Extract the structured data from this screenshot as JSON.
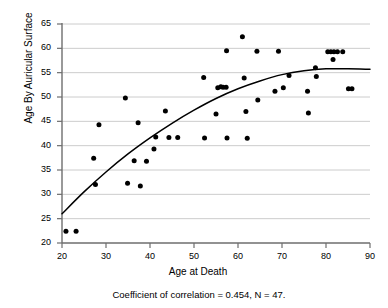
{
  "chart_data": {
    "type": "scatter",
    "title": "",
    "xlabel": "Age at Death",
    "ylabel": "Age By Auricular Surface",
    "xlim": [
      20,
      90
    ],
    "ylim": [
      20,
      65
    ],
    "xticks": [
      20,
      30,
      40,
      50,
      60,
      70,
      80,
      90
    ],
    "yticks": [
      20,
      25,
      30,
      35,
      40,
      45,
      50,
      55,
      60,
      65
    ],
    "grid": "horizontal",
    "legend": "none",
    "caption": "Coefficient of correlation = 0.454, N = 47.",
    "annotations": {
      "correlation": "0.454",
      "n": "47"
    },
    "marker_color": "#000000",
    "fit_line_color": "#000000",
    "axis_color": "#6e6e6e",
    "grid_color": "#cccccc",
    "points": [
      {
        "x": 20.9,
        "y": 22.4
      },
      {
        "x": 23.2,
        "y": 22.4
      },
      {
        "x": 27.2,
        "y": 37.4
      },
      {
        "x": 27.6,
        "y": 32.0
      },
      {
        "x": 28.4,
        "y": 44.3
      },
      {
        "x": 34.4,
        "y": 49.8
      },
      {
        "x": 34.9,
        "y": 32.3
      },
      {
        "x": 36.4,
        "y": 36.9
      },
      {
        "x": 37.3,
        "y": 44.7
      },
      {
        "x": 37.8,
        "y": 31.7
      },
      {
        "x": 39.2,
        "y": 36.8
      },
      {
        "x": 40.9,
        "y": 39.3
      },
      {
        "x": 41.3,
        "y": 41.8
      },
      {
        "x": 43.5,
        "y": 47.1
      },
      {
        "x": 44.3,
        "y": 41.7
      },
      {
        "x": 46.3,
        "y": 41.7
      },
      {
        "x": 52.2,
        "y": 54.0
      },
      {
        "x": 52.4,
        "y": 41.6
      },
      {
        "x": 55.0,
        "y": 46.5
      },
      {
        "x": 55.4,
        "y": 51.9
      },
      {
        "x": 56.1,
        "y": 52.1
      },
      {
        "x": 56.6,
        "y": 52.0
      },
      {
        "x": 57.3,
        "y": 52.0
      },
      {
        "x": 57.4,
        "y": 59.5
      },
      {
        "x": 57.5,
        "y": 41.6
      },
      {
        "x": 61.0,
        "y": 62.4
      },
      {
        "x": 61.4,
        "y": 53.9
      },
      {
        "x": 61.8,
        "y": 47.0
      },
      {
        "x": 62.1,
        "y": 41.5
      },
      {
        "x": 64.3,
        "y": 59.4
      },
      {
        "x": 64.5,
        "y": 49.4
      },
      {
        "x": 68.4,
        "y": 51.2
      },
      {
        "x": 69.2,
        "y": 59.4
      },
      {
        "x": 70.3,
        "y": 51.9
      },
      {
        "x": 71.6,
        "y": 54.4
      },
      {
        "x": 75.8,
        "y": 51.2
      },
      {
        "x": 76.0,
        "y": 46.7
      },
      {
        "x": 77.6,
        "y": 56.0
      },
      {
        "x": 77.8,
        "y": 54.2
      },
      {
        "x": 80.4,
        "y": 59.3
      },
      {
        "x": 81.1,
        "y": 59.3
      },
      {
        "x": 81.6,
        "y": 57.7
      },
      {
        "x": 81.8,
        "y": 59.3
      },
      {
        "x": 82.6,
        "y": 59.3
      },
      {
        "x": 83.8,
        "y": 59.3
      },
      {
        "x": 85.1,
        "y": 51.7
      },
      {
        "x": 85.9,
        "y": 51.7
      }
    ],
    "fit_curve": [
      {
        "x": 20.0,
        "y": 26.0
      },
      {
        "x": 25.0,
        "y": 30.5
      },
      {
        "x": 30.0,
        "y": 34.6
      },
      {
        "x": 35.0,
        "y": 38.3
      },
      {
        "x": 40.0,
        "y": 41.6
      },
      {
        "x": 45.0,
        "y": 44.6
      },
      {
        "x": 50.0,
        "y": 47.3
      },
      {
        "x": 55.0,
        "y": 49.7
      },
      {
        "x": 60.0,
        "y": 51.7
      },
      {
        "x": 65.0,
        "y": 53.3
      },
      {
        "x": 70.0,
        "y": 54.6
      },
      {
        "x": 75.0,
        "y": 55.4
      },
      {
        "x": 80.0,
        "y": 55.8
      },
      {
        "x": 85.0,
        "y": 55.8
      },
      {
        "x": 90.0,
        "y": 55.7
      }
    ]
  },
  "axes": {
    "y_label": "Age By Auricular Surface",
    "x_label": "Age at Death",
    "y_tick_labels": [
      "65",
      "60",
      "55",
      "50",
      "45",
      "40",
      "35",
      "30",
      "25",
      "20"
    ],
    "x_tick_labels": [
      "20",
      "30",
      "40",
      "50",
      "60",
      "70",
      "80",
      "90"
    ]
  },
  "caption": {
    "text": "Coefficient of correlation = 0.454, N = 47."
  }
}
